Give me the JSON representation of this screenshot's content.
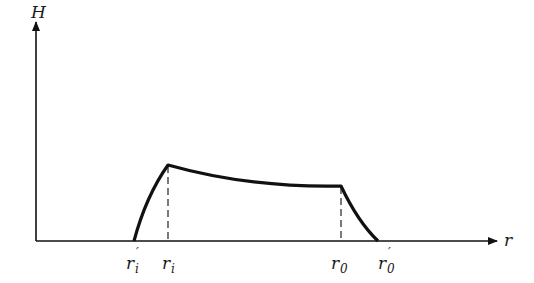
{
  "diagram": {
    "y_axis_label": "H",
    "x_axis_label": "r",
    "ticks": [
      {
        "id": "ri_prime",
        "base": "r",
        "sub": "i",
        "prime": true
      },
      {
        "id": "ri",
        "base": "r",
        "sub": "i",
        "prime": false
      },
      {
        "id": "r0",
        "base": "r",
        "sub": "0",
        "prime": false
      },
      {
        "id": "r0_prime",
        "base": "r",
        "sub": "0",
        "prime": true
      }
    ],
    "colors": {
      "line": "#111111",
      "background": "#ffffff"
    }
  }
}
